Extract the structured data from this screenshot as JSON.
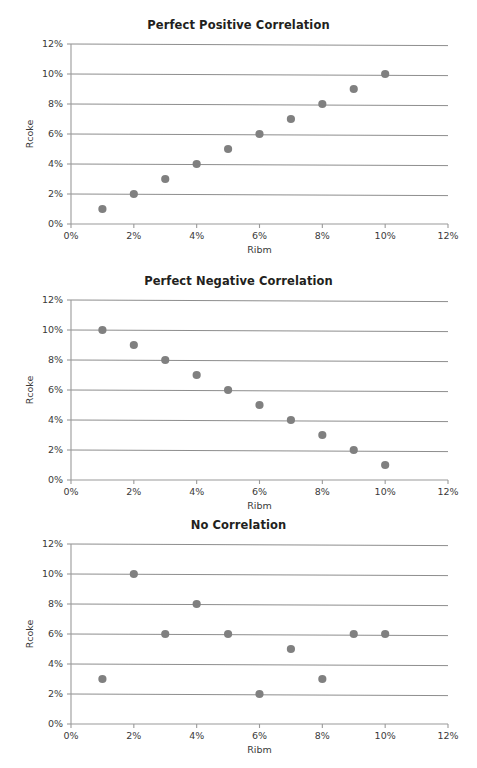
{
  "figure": {
    "background_color": "#ffffff",
    "point_color": "#808080",
    "gridline_color": "#808080",
    "axis_color": "#9a9a9a",
    "text_color": "#231f20"
  },
  "charts": [
    {
      "id": "chart-0",
      "chart_data": {
        "type": "scatter",
        "title": "Perfect Positive Correlation",
        "xlabel": "Ribm",
        "ylabel": "Rcoke",
        "xlim": [
          0,
          12
        ],
        "ylim": [
          0,
          12
        ],
        "grid": true,
        "legend": "none",
        "xticks": [
          "0%",
          "2%",
          "4%",
          "6%",
          "8%",
          "10%",
          "12%"
        ],
        "xtick_values": [
          0,
          2,
          4,
          6,
          8,
          10,
          12
        ],
        "yticks": [
          "0%",
          "2%",
          "4%",
          "6%",
          "8%",
          "10%",
          "12%"
        ],
        "ytick_values": [
          0,
          2,
          4,
          6,
          8,
          10,
          12
        ],
        "x": [
          1,
          2,
          3,
          4,
          5,
          6,
          7,
          8,
          9,
          10
        ],
        "y": [
          1,
          2,
          3,
          4,
          5,
          6,
          7,
          8,
          9,
          10
        ]
      }
    },
    {
      "id": "chart-1",
      "chart_data": {
        "type": "scatter",
        "title": "Perfect Negative Correlation",
        "xlabel": "Ribm",
        "ylabel": "Rcoke",
        "xlim": [
          0,
          12
        ],
        "ylim": [
          0,
          12
        ],
        "grid": true,
        "legend": "none",
        "xticks": [
          "0%",
          "2%",
          "4%",
          "6%",
          "8%",
          "10%",
          "12%"
        ],
        "xtick_values": [
          0,
          2,
          4,
          6,
          8,
          10,
          12
        ],
        "yticks": [
          "0%",
          "2%",
          "4%",
          "6%",
          "8%",
          "10%",
          "12%"
        ],
        "ytick_values": [
          0,
          2,
          4,
          6,
          8,
          10,
          12
        ],
        "x": [
          1,
          2,
          3,
          4,
          5,
          6,
          7,
          8,
          9,
          10
        ],
        "y": [
          10,
          9,
          8,
          7,
          6,
          5,
          4,
          3,
          2,
          1
        ]
      }
    },
    {
      "id": "chart-2",
      "chart_data": {
        "type": "scatter",
        "title": "No Correlation",
        "xlabel": "Ribm",
        "ylabel": "Rcoke",
        "xlim": [
          0,
          12
        ],
        "ylim": [
          0,
          12
        ],
        "grid": true,
        "legend": "none",
        "xticks": [
          "0%",
          "2%",
          "4%",
          "6%",
          "8%",
          "10%",
          "12%"
        ],
        "xtick_values": [
          0,
          2,
          4,
          6,
          8,
          10,
          12
        ],
        "yticks": [
          "0%",
          "2%",
          "4%",
          "6%",
          "8%",
          "10%",
          "12%"
        ],
        "ytick_values": [
          0,
          2,
          4,
          6,
          8,
          10,
          12
        ],
        "x": [
          1,
          2,
          3,
          4,
          5,
          6,
          7,
          8,
          9,
          10
        ],
        "y": [
          3,
          10,
          6,
          8,
          6,
          2,
          5,
          3,
          6,
          6
        ]
      }
    }
  ]
}
